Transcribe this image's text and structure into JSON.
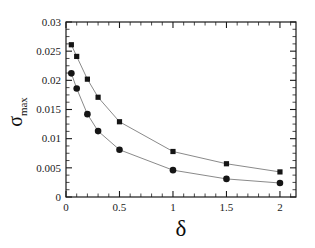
{
  "chart_data": {
    "type": "scatter",
    "title": "",
    "xlabel": "δ",
    "ylabel": "σ_max",
    "ylabel_base": "σ",
    "ylabel_sub": "max",
    "xlim": [
      0,
      2.15
    ],
    "ylim": [
      0,
      0.03
    ],
    "grid": false,
    "legend": "none",
    "xticks": [
      0,
      0.5,
      1,
      1.5,
      2
    ],
    "xticklabels": [
      "0",
      "0.5",
      "1",
      "1.5",
      "2"
    ],
    "xminor_step": 0.1,
    "yticks": [
      0,
      0.005,
      0.01,
      0.015,
      0.02,
      0.025,
      0.03
    ],
    "yticklabels": [
      "0",
      "0.005",
      "0.01",
      "0.015",
      "0.02",
      "0.025",
      "0.03"
    ],
    "yminor_step": 0.00125,
    "series": [
      {
        "name": "upper-branch",
        "marker": "square",
        "color": "#151515",
        "line_color": "#8a8a8a",
        "x": [
          0.05,
          0.1,
          0.2,
          0.3,
          0.5,
          1.0,
          1.5,
          2.0
        ],
        "values": [
          0.0261,
          0.0241,
          0.0202,
          0.0171,
          0.0129,
          0.0078,
          0.0057,
          0.0043
        ]
      },
      {
        "name": "lower-branch",
        "marker": "circle",
        "color": "#151515",
        "line_color": "#8a8a8a",
        "x": [
          0.05,
          0.1,
          0.2,
          0.3,
          0.5,
          1.0,
          1.5,
          2.0
        ],
        "values": [
          0.0212,
          0.0186,
          0.0142,
          0.0113,
          0.0081,
          0.0046,
          0.0031,
          0.0024
        ]
      }
    ]
  }
}
